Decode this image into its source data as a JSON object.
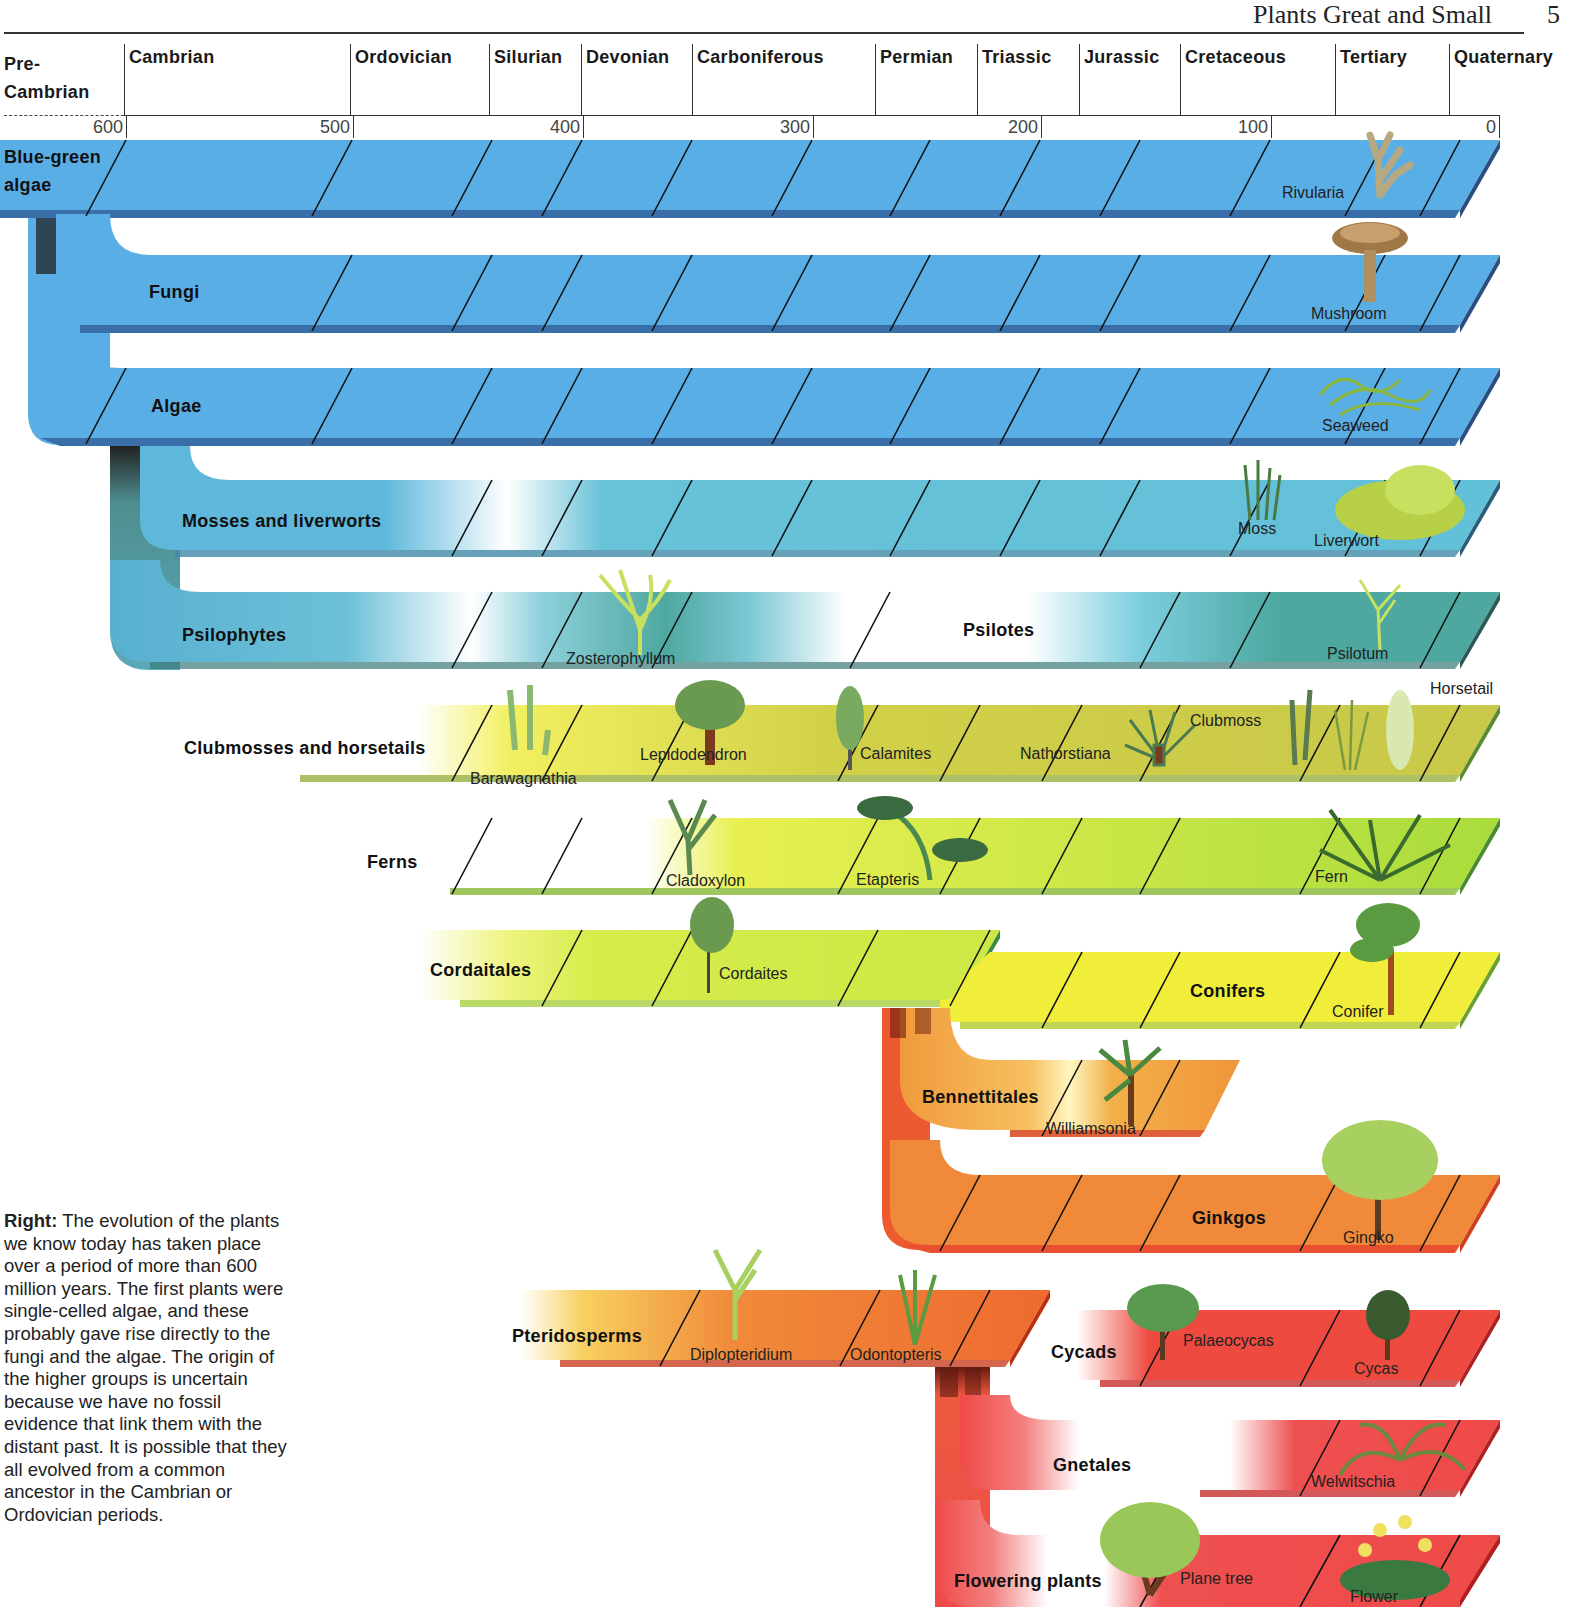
{
  "header": {
    "title": "Plants Great and Small",
    "page_number": "5"
  },
  "timeline": {
    "periods": [
      {
        "name": "Pre-Cambrian",
        "line1": "Pre-",
        "line2": "Cambrian",
        "x": 4
      },
      {
        "name": "Cambrian",
        "x": 127
      },
      {
        "name": "Ordovician",
        "x": 353
      },
      {
        "name": "Silurian",
        "x": 492
      },
      {
        "name": "Devonian",
        "x": 584
      },
      {
        "name": "Carboniferous",
        "x": 695
      },
      {
        "name": "Permian",
        "x": 878
      },
      {
        "name": "Triassic",
        "x": 980
      },
      {
        "name": "Jurassic",
        "x": 1082
      },
      {
        "name": "Cretaceous",
        "x": 1183
      },
      {
        "name": "Tertiary",
        "x": 1338
      },
      {
        "name": "Quaternary",
        "x": 1452
      }
    ],
    "ticks": [
      {
        "label": "600",
        "x": 126
      },
      {
        "label": "500",
        "x": 352
      },
      {
        "label": "400",
        "x": 582
      },
      {
        "label": "300",
        "x": 812
      },
      {
        "label": "200",
        "x": 1040
      },
      {
        "label": "100",
        "x": 1270
      },
      {
        "label": "0",
        "x": 1498
      }
    ],
    "unit": "million years ago"
  },
  "groups": [
    {
      "name": "Blue-green algae",
      "line1": "Blue-green",
      "line2": "algae",
      "color": "#5aaee6",
      "examples": [
        "Rivularia"
      ]
    },
    {
      "name": "Fungi",
      "color": "#5aaee6",
      "examples": [
        "Mushroom"
      ]
    },
    {
      "name": "Algae",
      "color": "#5aaee6",
      "examples": [
        "Seaweed"
      ]
    },
    {
      "name": "Mosses and liverworts",
      "color": "#62c0d8",
      "examples": [
        "Moss",
        "Liverwort"
      ]
    },
    {
      "name": "Psilophytes",
      "color": "#4ea8a0",
      "examples": [
        "Zosterophyllum"
      ]
    },
    {
      "name": "Psilotes",
      "color": "#4ea8a0",
      "examples": [
        "Psilotum"
      ]
    },
    {
      "name": "Clubmosses and horsetails",
      "color": "#cfd04a",
      "examples": [
        "Barawagnathia",
        "Lepidodendron",
        "Calamites",
        "Nathorstiana",
        "Clubmoss",
        "Horsetail"
      ]
    },
    {
      "name": "Ferns",
      "color": "#bfe040",
      "examples": [
        "Cladoxylon",
        "Etapteris",
        "Fern"
      ]
    },
    {
      "name": "Cordaitales",
      "color": "#d4ec48",
      "examples": [
        "Cordaites"
      ]
    },
    {
      "name": "Conifers",
      "color": "#f0ee3a",
      "examples": [
        "Conifer"
      ]
    },
    {
      "name": "Bennettitales",
      "color": "#f0953a",
      "examples": [
        "Williamsonia"
      ]
    },
    {
      "name": "Ginkgos",
      "color": "#f08a3a",
      "examples": [
        "Gingko"
      ]
    },
    {
      "name": "Pteridosperms",
      "color": "#ee6a30",
      "examples": [
        "Diplopteridium",
        "Odontopteris"
      ]
    },
    {
      "name": "Cycads",
      "color": "#ee4a40",
      "examples": [
        "Palaeocycas",
        "Cycas"
      ]
    },
    {
      "name": "Gnetales",
      "color": "#ee4a48",
      "examples": [
        "Welwitschia"
      ]
    },
    {
      "name": "Flowering plants",
      "color": "#ee4a48",
      "examples": [
        "Plane tree",
        "Flower"
      ]
    }
  ],
  "caption": {
    "lead": "Right:",
    "text": " The evolution of the plants we know today has taken place over a period of more than 600 million years. The first plants were single-celled algae, and these probably gave rise directly to the fungi and the algae. The origin of the higher groups is uncertain because we have no fossil evidence that link them with the distant past. It is possible that they all evolved from a common ancestor in the Cambrian or Ordovician periods."
  }
}
